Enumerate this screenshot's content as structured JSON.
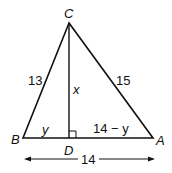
{
  "diagram": {
    "vertices": {
      "C": "C",
      "B": "B",
      "A": "A",
      "D": "D"
    },
    "sides": {
      "BC": "13",
      "CA": "15",
      "CD": "x",
      "BD": "y",
      "DA": "14 − y"
    },
    "base_length": "14",
    "right_angle_at": "D",
    "colors": {
      "stroke": "#111111",
      "background": "#ffffff"
    }
  }
}
